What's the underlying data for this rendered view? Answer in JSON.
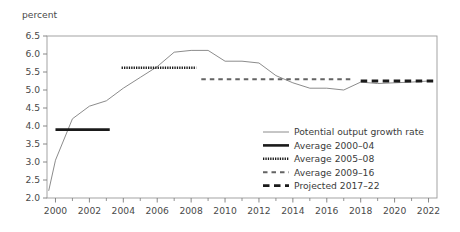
{
  "chart_data": {
    "type": "line",
    "title": "",
    "subtitle": "",
    "ylabel": "percent",
    "xlabel": "",
    "ylim": [
      2.0,
      6.5
    ],
    "xlim": [
      1999.5,
      2022.5
    ],
    "grid": false,
    "legend_position": "inside-bottom-right",
    "y_ticks": [
      "2.0",
      "2.5",
      "3.0",
      "3.5",
      "4.0",
      "4.5",
      "5.0",
      "5.5",
      "6.0",
      "6.5"
    ],
    "y_tick_values": [
      2.0,
      2.5,
      3.0,
      3.5,
      4.0,
      4.5,
      5.0,
      5.5,
      6.0,
      6.5
    ],
    "x_ticks": [
      "2000",
      "2002",
      "2004",
      "2006",
      "2008",
      "2010",
      "2012",
      "2014",
      "2016",
      "2018",
      "2020",
      "2022"
    ],
    "x_tick_values": [
      2000,
      2002,
      2004,
      2006,
      2008,
      2010,
      2012,
      2014,
      2016,
      2018,
      2020,
      2022
    ],
    "x_minor_ticks": [
      2001,
      2003,
      2005,
      2007,
      2009,
      2011,
      2013,
      2015,
      2017,
      2019,
      2021
    ],
    "series": [
      {
        "name": "Potential output growth rate",
        "style": "solid-thin",
        "color": "#8c8c8c",
        "x": [
          1999.6,
          2000,
          2001,
          2002,
          2003,
          2004,
          2005,
          2006,
          2007,
          2008,
          2009,
          2010,
          2011,
          2012,
          2013,
          2014,
          2015,
          2016,
          2017,
          2018,
          2019,
          2020,
          2021,
          2022
        ],
        "values": [
          2.2,
          3.05,
          4.2,
          4.55,
          4.7,
          5.05,
          5.35,
          5.65,
          6.05,
          6.1,
          6.1,
          5.8,
          5.8,
          5.75,
          5.4,
          5.2,
          5.05,
          5.05,
          5.0,
          5.22,
          5.18,
          5.2,
          5.22,
          5.25
        ]
      },
      {
        "name": "Average 2000–04",
        "style": "solid-thick",
        "color": "#1a1a1a",
        "x": [
          2000,
          2003.2
        ],
        "values": [
          3.9,
          3.9
        ],
        "level": 3.9
      },
      {
        "name": "Average 2005–08",
        "style": "dotted",
        "color": "#1a1a1a",
        "x": [
          2003.9,
          2008.3
        ],
        "values": [
          5.62,
          5.62
        ],
        "level": 5.62
      },
      {
        "name": "Average 2009–16",
        "style": "dashed-small",
        "color": "#636363",
        "x": [
          2008.6,
          2017.5
        ],
        "values": [
          5.3,
          5.3
        ],
        "level": 5.3
      },
      {
        "name": "Projected 2017–22",
        "style": "dashed-thick",
        "color": "#1a1a1a",
        "x": [
          2018.0,
          2022.4
        ],
        "values": [
          5.25,
          5.25
        ],
        "level": 5.25
      }
    ],
    "legend": [
      {
        "label": "Potential output growth rate",
        "style": "solid-thin",
        "color": "#8c8c8c"
      },
      {
        "label": "Average 2000–04",
        "style": "solid-thick",
        "color": "#1a1a1a"
      },
      {
        "label": "Average 2005–08",
        "style": "dotted",
        "color": "#1a1a1a"
      },
      {
        "label": "Average 2009–16",
        "style": "dashed-small",
        "color": "#636363"
      },
      {
        "label": "Projected 2017–22",
        "style": "dashed-thick",
        "color": "#1a1a1a"
      }
    ],
    "colors": {
      "axis": "#7a7a7a",
      "frame": "#9a9a9a",
      "text": "#3b3b3b",
      "line_main": "#8c8c8c",
      "line_dark": "#1a1a1a",
      "background": "#ffffff"
    }
  }
}
